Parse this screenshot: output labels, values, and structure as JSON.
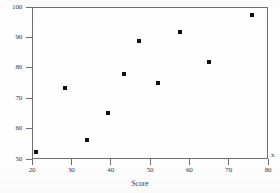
{
  "chart_data": {
    "type": "scatter",
    "title": "",
    "subtitle": "",
    "xlabel": "Score",
    "ylabel": "",
    "xlim": [
      20,
      80
    ],
    "ylim": [
      50,
      100
    ],
    "grid": false,
    "legend": null,
    "legend_position": "none",
    "xticks": [
      20,
      30,
      40,
      50,
      60,
      70,
      80
    ],
    "xtick_labels": [
      "20",
      "30",
      "40",
      "50",
      "60",
      "70",
      "80"
    ],
    "yticks": [
      50,
      60,
      70,
      80,
      90,
      100
    ],
    "ytick_labels": [
      "50",
      "60",
      "70",
      "80",
      "90",
      "100"
    ],
    "marker": "square",
    "marker_color": "#111111",
    "marker_size": 4,
    "frame_color": "#6f6f6f",
    "background_color": "#fefefe",
    "annotations": [
      {
        "text": "x",
        "position": "right-of-x-axis"
      }
    ],
    "points": [
      {
        "x": 21.0,
        "y": 52.3
      },
      {
        "x": 28.3,
        "y": 73.3
      },
      {
        "x": 33.9,
        "y": 56.2
      },
      {
        "x": 39.3,
        "y": 65.2
      },
      {
        "x": 43.3,
        "y": 78.0
      },
      {
        "x": 47.3,
        "y": 88.8
      },
      {
        "x": 52.1,
        "y": 75.0
      },
      {
        "x": 57.5,
        "y": 91.8
      },
      {
        "x": 65.0,
        "y": 81.8
      },
      {
        "x": 76.0,
        "y": 97.3
      }
    ]
  },
  "figure": {
    "xaxis_title": "Score",
    "x_variable_marker": "x"
  }
}
